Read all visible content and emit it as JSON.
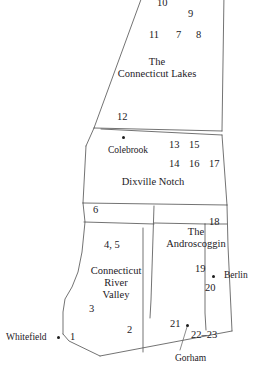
{
  "map": {
    "title": "Northern New Hampshire regions map",
    "stroke_color": "#5a5a5a",
    "text_color": "#23201e",
    "background_color": "#ffffff",
    "region_labels": [
      {
        "id": "connecticut-lakes",
        "line1": "The",
        "line2": "Connecticut Lakes",
        "x": 157,
        "y": 62
      },
      {
        "id": "dixville-notch",
        "line1": "Dixville Notch",
        "line2": "",
        "x": 153,
        "y": 180
      },
      {
        "id": "androscoggin",
        "line1": "The",
        "line2": "Androscoggin",
        "x": 196,
        "y": 232
      },
      {
        "id": "connecticut-river-valley",
        "line1": "Connecticut",
        "line2": "River",
        "line3": "Valley",
        "x": 116,
        "y": 270
      }
    ],
    "cities": [
      {
        "id": "colebrook",
        "label": "Colebrook",
        "label_x": 128,
        "label_y": 148,
        "dot_x": 123,
        "dot_y": 138,
        "label_anchor": "center",
        "leader": false
      },
      {
        "id": "berlin",
        "label": "Berlin",
        "label_x": 227,
        "label_y": 273,
        "dot_x": 213,
        "dot_y": 277,
        "label_anchor": "left",
        "leader": false
      },
      {
        "id": "whitefield",
        "label": "Whitefield",
        "label_x": 8,
        "label_y": 334,
        "dot_x": 58,
        "dot_y": 338,
        "label_anchor": "left",
        "leader": false
      },
      {
        "id": "gorham",
        "label": "Gorham",
        "label_x": 176,
        "label_y": 356,
        "dot_x": 187,
        "dot_y": 325,
        "label_anchor": "left",
        "leader": true
      }
    ],
    "numbers": [
      {
        "text": "10",
        "x": 161,
        "y": 0
      },
      {
        "text": "9",
        "x": 191,
        "y": 10
      },
      {
        "text": "11",
        "x": 152,
        "y": 31
      },
      {
        "text": "7",
        "x": 178,
        "y": 31
      },
      {
        "text": "8",
        "x": 199,
        "y": 31
      },
      {
        "text": "12",
        "x": 119,
        "y": 113
      },
      {
        "text": "13",
        "x": 171,
        "y": 141
      },
      {
        "text": "15",
        "x": 190,
        "y": 141
      },
      {
        "text": "14",
        "x": 171,
        "y": 160
      },
      {
        "text": "16",
        "x": 191,
        "y": 160
      },
      {
        "text": "17",
        "x": 211,
        "y": 160
      },
      {
        "text": "6",
        "x": 95,
        "y": 206
      },
      {
        "text": "18",
        "x": 211,
        "y": 218
      },
      {
        "text": "4, 5",
        "x": 108,
        "y": 241
      },
      {
        "text": "19",
        "x": 197,
        "y": 265
      },
      {
        "text": "20",
        "x": 207,
        "y": 284
      },
      {
        "text": "3",
        "x": 91,
        "y": 305
      },
      {
        "text": "1",
        "x": 71,
        "y": 333
      },
      {
        "text": "2",
        "x": 129,
        "y": 326
      },
      {
        "text": "21",
        "x": 172,
        "y": 320
      },
      {
        "text": "22–23",
        "x": 193,
        "y": 331
      }
    ],
    "boundaries": {
      "outer_outline": "M 143 0 L 94 128 L 101 129 L 82 159 L 84 201 L 85 221 L 81 255 L 77 274 L 72 288 L 63 304 L 63 334 L 68 340 L 100 356 L 232 331 L 228 246 L 227 205 L 222 131 L 224 0 Z",
      "internal_lines": [
        "M 94 128 L 222 131",
        "M 101 129 L 222 135",
        "M 83 203 L 227 205",
        "M 84 201 L 227 203",
        "M 154 204 L 150 317",
        "M 143 206 L 143 352",
        "M 227 222 L 205 220",
        "M 205 220 L 205 331",
        "M 63 334 L 100 356",
        "M 100 356 L 232 331"
      ]
    }
  }
}
